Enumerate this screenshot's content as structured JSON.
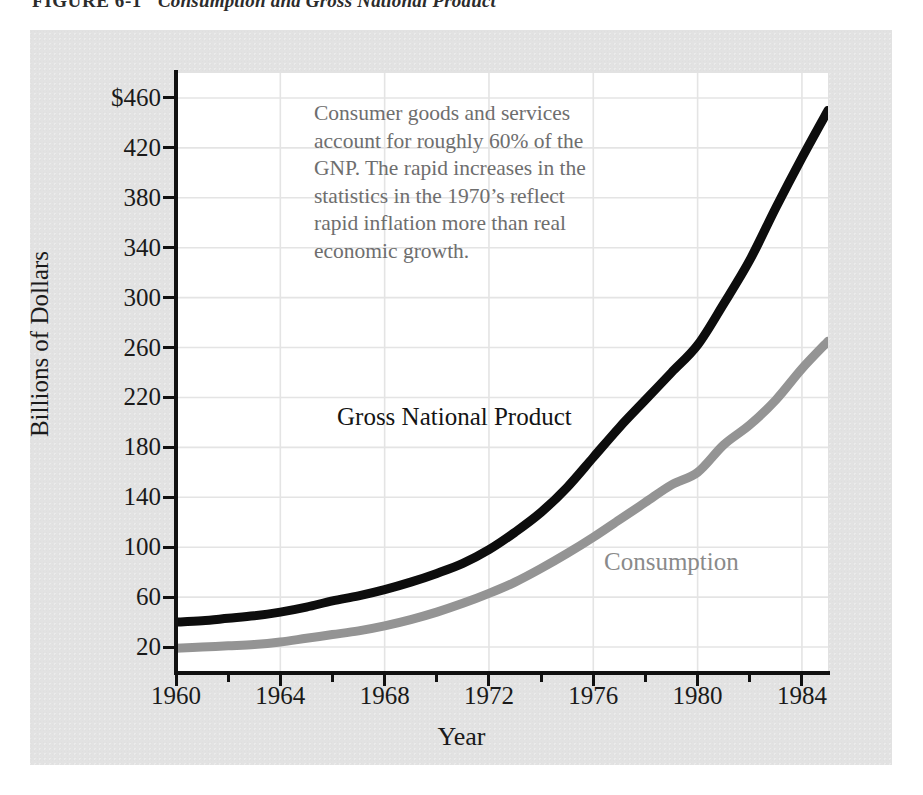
{
  "figure": {
    "number": "FIGURE 6-1",
    "title": "Consumption and Gross National Product"
  },
  "note": "Consumer goods and services account for roughly 60% of the GNP. The rapid increases in the statistics in the 1970’s reflect rapid inflation more than real economic growth.",
  "labels": {
    "gnp": "Gross National Product",
    "consumption": "Consumption"
  },
  "colors": {
    "panel": "#e2e2e2",
    "plot_background": "#ffffff",
    "grid": "#e4e4e4",
    "axis": "#111111",
    "gnp_line": "#0d0d0d",
    "consumption_line": "#949494",
    "note_text": "#6e6e6e",
    "tick_text": "#1a1a1a"
  },
  "chart_data": {
    "type": "line",
    "title": "Consumption and Gross National Product",
    "xlabel": "Year",
    "ylabel": "Billions of Dollars",
    "xlim": [
      1960,
      1985
    ],
    "ylim": [
      0,
      480
    ],
    "grid": true,
    "legend": "inline-labels",
    "x_ticks": [
      1960,
      1964,
      1968,
      1972,
      1976,
      1980,
      1984
    ],
    "x_tick_labels": [
      "1960",
      "1964",
      "1968",
      "1972",
      "1976",
      "1980",
      "1984"
    ],
    "x_minor_ticks": [
      1962,
      1966,
      1970,
      1974,
      1978,
      1982
    ],
    "y_ticks": [
      20,
      60,
      100,
      140,
      180,
      220,
      260,
      300,
      340,
      380,
      420,
      460
    ],
    "y_tick_labels": [
      "20",
      "60",
      "100",
      "140",
      "180",
      "220",
      "260",
      "300",
      "340",
      "380",
      "420",
      "$460"
    ],
    "x": [
      1960,
      1961,
      1962,
      1963,
      1964,
      1965,
      1966,
      1967,
      1968,
      1969,
      1970,
      1971,
      1972,
      1973,
      1974,
      1975,
      1976,
      1977,
      1978,
      1979,
      1980,
      1981,
      1982,
      1983,
      1984,
      1985
    ],
    "series": [
      {
        "name": "Gross National Product",
        "color": "#0d0d0d",
        "values": [
          40,
          41,
          43,
          45,
          48,
          52,
          57,
          61,
          66,
          72,
          79,
          87,
          98,
          112,
          128,
          148,
          172,
          196,
          218,
          240,
          262,
          295,
          330,
          372,
          412,
          450
        ]
      },
      {
        "name": "Consumption",
        "color": "#949494",
        "values": [
          19,
          20,
          21,
          22,
          24,
          27,
          30,
          33,
          37,
          42,
          48,
          55,
          63,
          72,
          83,
          95,
          108,
          122,
          136,
          150,
          160,
          182,
          198,
          218,
          243,
          265
        ]
      }
    ]
  }
}
